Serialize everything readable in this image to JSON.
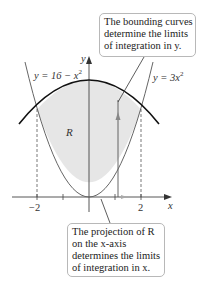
{
  "diagram": {
    "type": "region-between-curves",
    "curves": [
      {
        "name": "upper",
        "equation_label": "y = 16 − x",
        "exponent": "2"
      },
      {
        "name": "lower",
        "equation_label": "y = 3x",
        "exponent": "2"
      }
    ],
    "region_label": "R",
    "axes": {
      "x_label": "x",
      "y_label": "y",
      "x_ticks": [
        "−2",
        "2"
      ]
    },
    "callouts": {
      "top": {
        "lines": [
          "The bounding curves",
          "determine the limits",
          "of integration in y."
        ]
      },
      "bottom": {
        "lines": [
          "The projection of R",
          "on the x-axis",
          "determines the limits",
          "of integration in x."
        ]
      }
    },
    "colors": {
      "region_fill": "#e6e6e6",
      "upper_curve": "#111111",
      "lower_curve": "#666666",
      "axis": "#444444"
    }
  }
}
